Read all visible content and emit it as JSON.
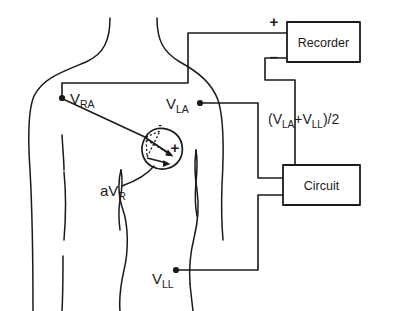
{
  "diagram": {
    "type": "electrode-circuit-schematic",
    "stroke_color": "#1a1a1a",
    "background_color": "#ffffff"
  },
  "electrodes": [
    {
      "id": "vra",
      "label_main": "V",
      "label_sub": "RA",
      "name": "right-arm-electrode",
      "position": {
        "x": 62,
        "y": 98
      }
    },
    {
      "id": "vla",
      "label_main": "V",
      "label_sub": "LA",
      "name": "left-arm-electrode",
      "position": {
        "x": 200,
        "y": 103
      }
    },
    {
      "id": "vll",
      "label_main": "V",
      "label_sub": "LL",
      "name": "left-leg-electrode",
      "position": {
        "x": 176,
        "y": 270
      }
    }
  ],
  "boxes": [
    {
      "id": "recorder",
      "label": "Recorder",
      "name": "recorder-box",
      "rect": {
        "x": 287,
        "y": 22,
        "w": 73,
        "h": 40
      }
    },
    {
      "id": "circuit",
      "label": "Circuit",
      "name": "circuit-box",
      "rect": {
        "x": 283,
        "y": 165,
        "w": 77,
        "h": 40
      }
    }
  ],
  "terminals": [
    {
      "id": "recorder_plus",
      "symbol": "+",
      "name": "recorder-positive-terminal",
      "x": 274,
      "y": 27
    },
    {
      "id": "recorder_minus",
      "symbol": "–",
      "name": "recorder-negative-terminal",
      "x": 274,
      "y": 58
    }
  ],
  "heart": {
    "name": "heart-vector-region",
    "center": {
      "x": 162,
      "y": 148
    },
    "radius": 20,
    "polarity_plus": "+",
    "polarity_minus": "-",
    "lead_label_main": "aV",
    "lead_label_sub": "R"
  },
  "annotations": [
    {
      "id": "average_formula",
      "name": "wilson-average-formula",
      "text_parts": [
        {
          "t": "(V",
          "sub": false
        },
        {
          "t": "LA",
          "sub": true
        },
        {
          "t": "+V",
          "sub": false
        },
        {
          "t": "LL",
          "sub": true
        },
        {
          "t": ")/2",
          "sub": false
        }
      ],
      "plain": "(VLA+VLL)/2",
      "position": {
        "x": 296,
        "y": 122
      }
    }
  ],
  "wires": [
    {
      "id": "vra_to_recorder_plus",
      "name": "wire-right-arm-to-recorder-positive",
      "path": "M 62 98 L 62 83 L 188 83 L 188 33 L 287 33"
    },
    {
      "id": "recorder_minus_to_circuit",
      "name": "wire-recorder-negative-to-circuit",
      "path": "M 287 58 L 265 58 L 265 80 L 295 80 L 295 165"
    },
    {
      "id": "vla_to_circuit",
      "name": "wire-left-arm-to-circuit",
      "path": "M 200 103 L 258 103 L 258 178 L 283 178"
    },
    {
      "id": "vll_to_circuit",
      "name": "wire-left-leg-to-circuit",
      "path": "M 176 270 L 258 270 L 258 195 L 283 195"
    }
  ],
  "body": {
    "name": "torso-outline",
    "paths": [
      "M 110 18 C 110 40, 104 54, 86 62 C 62 72, 43 78, 34 96 C 28 110, 28 140, 30 170 C 32 205, 33 250, 33 311",
      "M 157 18 C 157 40, 163 52, 180 62 C 200 73, 212 84, 218 100 C 224 118, 224 150, 222 185 C 221 212, 222 228, 223 240",
      "M 64 172 C 66 192, 66 216, 64 240",
      "M 62 135 C 63 152, 64 162, 64 170",
      "M 63 256 C 63 272, 63 292, 62 311",
      "M 121 170 C 118 180, 118 196, 123 210 C 128 224, 129 250, 124 270 C 120 288, 119 300, 120 311",
      "M 121 170 C 123 180, 122 190, 120 200 C 118 212, 119 222, 120 230",
      "M 196 150 C 194 165, 195 178, 197 190 C 199 204, 198 222, 194 238 C 190 254, 189 270, 190 284",
      "M 196 150 C 198 162, 197 172, 196 182 C 195 194, 195 206, 197 216",
      "M 190 284 C 191 294, 192 302, 193 311"
    ]
  }
}
